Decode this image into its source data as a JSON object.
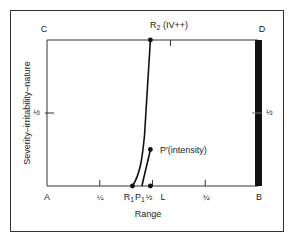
{
  "diagram": {
    "corners": {
      "top_left": "C",
      "top_right": "D",
      "bottom_left": "A",
      "bottom_right": "B"
    },
    "x_axis": {
      "label": "Range",
      "range": [
        0,
        1
      ],
      "ticks": [
        {
          "value": 0.25,
          "label": "¼"
        },
        {
          "value": 0.5,
          "label": "½"
        },
        {
          "value": 0.75,
          "label": "¾"
        }
      ]
    },
    "y_axis": {
      "label": "Severity–irritability–nature",
      "range": [
        0,
        1
      ],
      "ticks": [
        {
          "value": 0.5,
          "label": "½"
        }
      ],
      "right_tick_label": "½"
    },
    "points": {
      "R1": {
        "label_main": "R",
        "label_sub": "1",
        "x": 0.405,
        "y": 0
      },
      "P1": {
        "label_main": "P",
        "label_sub": "1",
        "x": 0.45,
        "y": 0
      },
      "half": {
        "label": "½",
        "x": 0.49,
        "y": 0
      },
      "L": {
        "label": "L",
        "x": 0.565,
        "y": 0
      },
      "R2": {
        "label_main": "R",
        "label_sub": "2",
        "label_suffix": " (IV++)",
        "x": 0.49,
        "y": 1
      },
      "P_prime": {
        "label": "P'(intensity)",
        "x": 0.49,
        "y": 0.25
      }
    },
    "curves": [
      {
        "name": "R-curve",
        "from": "R1",
        "to": "R2"
      },
      {
        "name": "P-curve",
        "from": "P1",
        "to": "P_prime"
      }
    ],
    "limit_bar": {
      "at_x": 1.0,
      "from_y": 0,
      "to_y": 1
    },
    "colors": {
      "ink": "#1a1a1a",
      "frame": "#333333",
      "background": "#ffffff"
    }
  }
}
